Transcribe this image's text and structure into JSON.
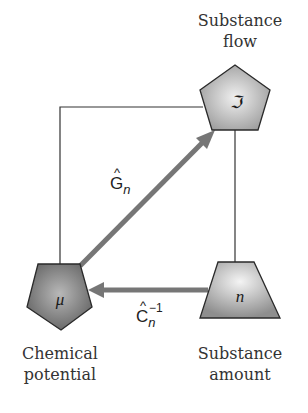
{
  "diagram": {
    "nodes": {
      "substance_flow": {
        "label_line1": "Substance",
        "label_line2": "flow",
        "symbol": "ℑ",
        "shape": "pentagon"
      },
      "chemical_potential": {
        "label_line1": "Chemical",
        "label_line2": "potential",
        "symbol": "μ",
        "shape": "inverted-pentagon"
      },
      "substance_amount": {
        "label_line1": "Substance",
        "label_line2": "amount",
        "symbol": "n",
        "shape": "trapezoid"
      }
    },
    "edges": {
      "g_operator": {
        "base": "G",
        "hat": "^",
        "subscript": "n",
        "from": "chemical_potential",
        "to": "substance_flow"
      },
      "c_inverse_operator": {
        "base": "C",
        "hat": "^",
        "subscript": "n",
        "superscript": "−1",
        "from": "substance_amount",
        "to": "chemical_potential"
      }
    },
    "colors": {
      "arrow": "#767676",
      "frame_line": "#333333",
      "shape_fill_light": "#e4e4e4",
      "shape_fill_dark": "#8a8a8a",
      "shape_stroke": "#2a2a2a"
    }
  }
}
